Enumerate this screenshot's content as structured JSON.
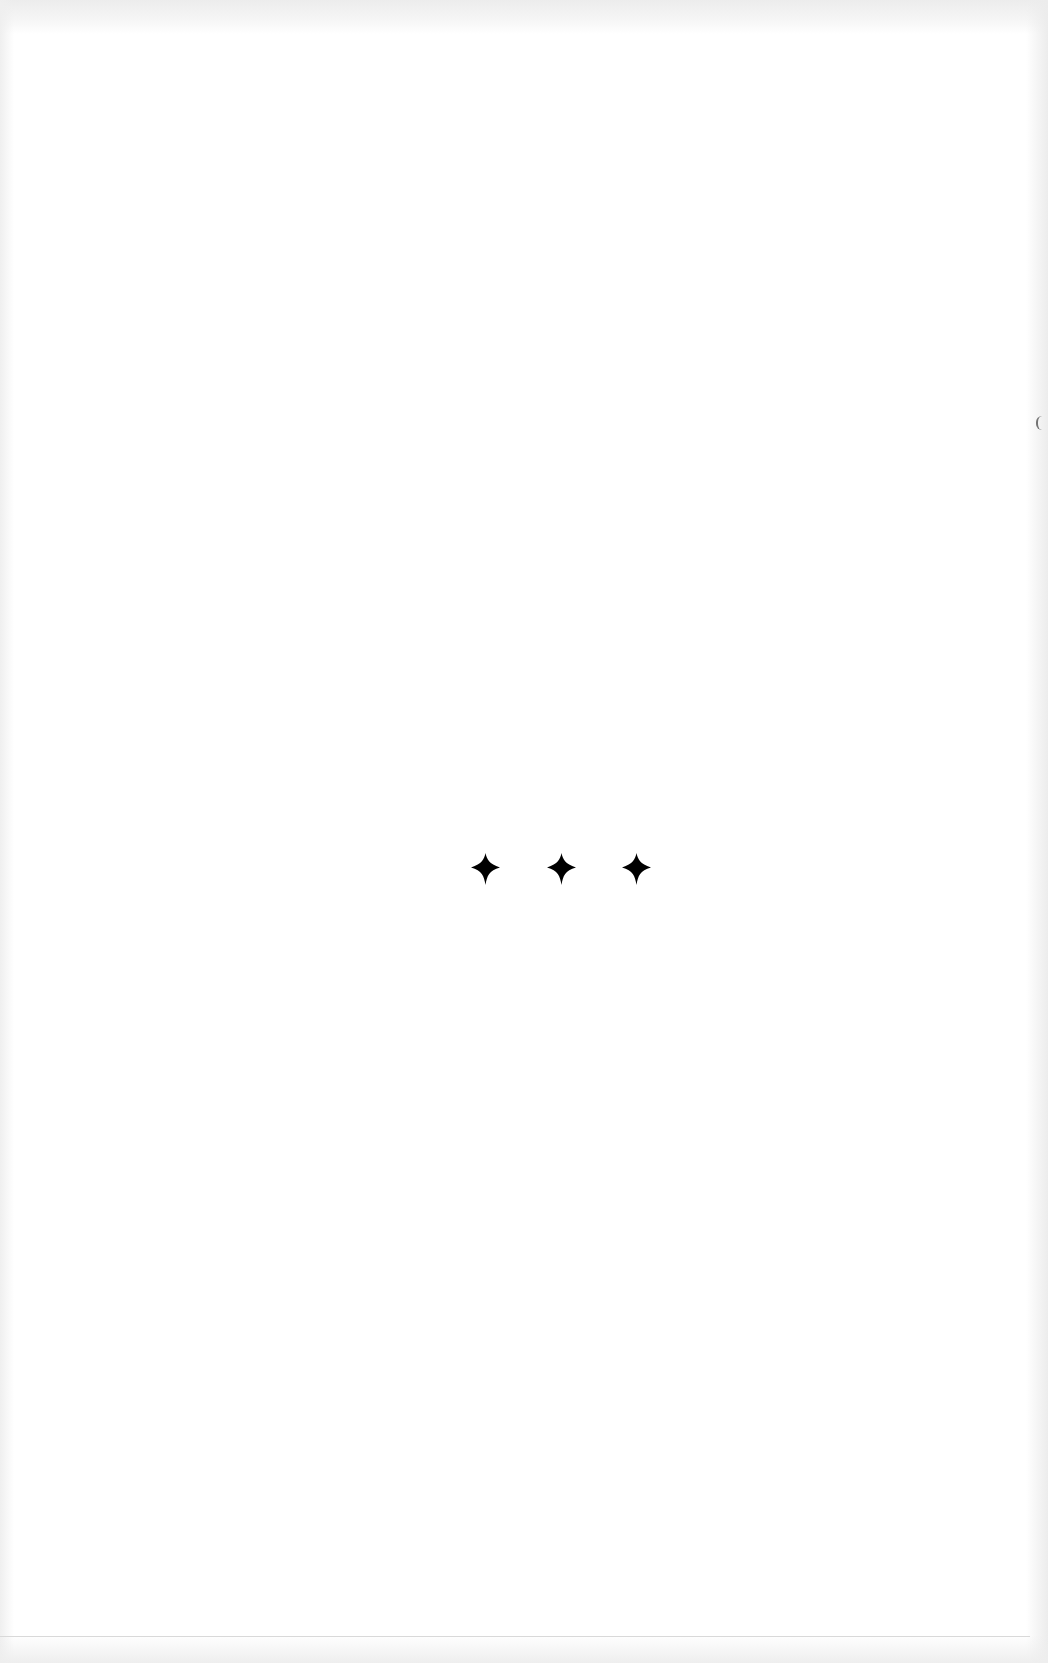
{
  "page": {
    "type": "scanned-book-page",
    "background_color": "#ffffff",
    "content": "section-break ornament only"
  },
  "ornament": {
    "label": "✦ ✦ ✦",
    "glyph": "four-pointed-star",
    "count": 3,
    "color": "#000000"
  }
}
